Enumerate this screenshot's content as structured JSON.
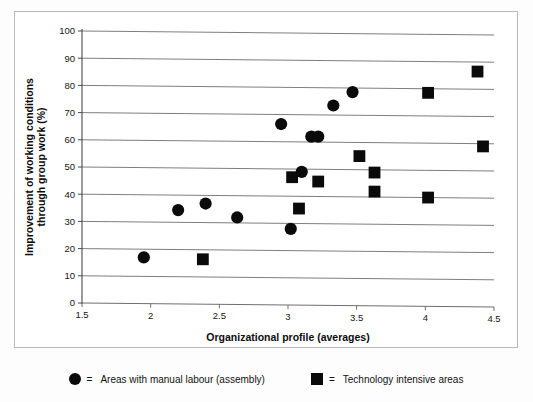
{
  "chart_data": {
    "type": "scatter",
    "title": "",
    "xlabel": "Organizational profile (averages)",
    "ylabel": "Improvement of working conditions through group work (%)",
    "xlim": [
      1.5,
      4.5
    ],
    "ylim": [
      0,
      100
    ],
    "xticks": [
      1.5,
      2,
      2.5,
      3,
      3.5,
      4,
      4.5
    ],
    "xtick_labels": [
      "1.5",
      "2",
      "2.5",
      "3",
      "3.5",
      "4",
      "4.5"
    ],
    "yticks": [
      0,
      10,
      20,
      30,
      40,
      50,
      60,
      70,
      80,
      90,
      100
    ],
    "ytick_labels": [
      "0",
      "10",
      "20",
      "30",
      "40",
      "50",
      "60",
      "70",
      "80",
      "90",
      "100"
    ],
    "grid": "horizontal",
    "legend_position": "below-plot",
    "marker_color": "#0a0a0a",
    "series": [
      {
        "name": "Areas with manual labour (assembly)",
        "marker": "circle",
        "color": "#0a0a0a",
        "points": [
          {
            "x": 1.95,
            "y": 17
          },
          {
            "x": 2.2,
            "y": 34.5
          },
          {
            "x": 2.4,
            "y": 37
          },
          {
            "x": 2.63,
            "y": 32
          },
          {
            "x": 2.95,
            "y": 66.5
          },
          {
            "x": 3.02,
            "y": 28
          },
          {
            "x": 3.1,
            "y": 49
          },
          {
            "x": 3.17,
            "y": 62
          },
          {
            "x": 3.22,
            "y": 62
          },
          {
            "x": 3.33,
            "y": 73.5
          },
          {
            "x": 3.47,
            "y": 78.5
          }
        ]
      },
      {
        "name": "Technology intensive areas",
        "marker": "square",
        "color": "#0a0a0a",
        "points": [
          {
            "x": 2.38,
            "y": 16.5
          },
          {
            "x": 3.03,
            "y": 47
          },
          {
            "x": 3.08,
            "y": 35.5
          },
          {
            "x": 3.22,
            "y": 45.5
          },
          {
            "x": 3.52,
            "y": 55
          },
          {
            "x": 3.63,
            "y": 49
          },
          {
            "x": 3.63,
            "y": 42
          },
          {
            "x": 4.02,
            "y": 40
          },
          {
            "x": 4.02,
            "y": 78.5
          },
          {
            "x": 4.38,
            "y": 86.5
          },
          {
            "x": 4.42,
            "y": 59
          }
        ]
      }
    ]
  },
  "legend": {
    "equals": "=",
    "items": [
      {
        "marker": "circle",
        "label": "Areas with manual labour (assembly)"
      },
      {
        "marker": "square",
        "label": "Technology intensive areas"
      }
    ]
  }
}
